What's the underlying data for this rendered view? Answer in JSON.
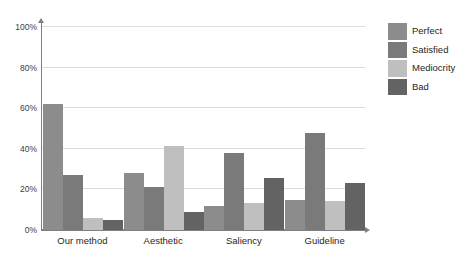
{
  "chart_data": {
    "type": "bar",
    "title": "",
    "subtitle": "",
    "xlabel": "",
    "ylabel": "",
    "categories": [
      "Our method",
      "Aesthetic",
      "Saliency",
      "Guideline"
    ],
    "series": [
      {
        "name": "Perfect",
        "color": "#8c8c8c",
        "values": [
          62,
          28,
          12,
          15
        ]
      },
      {
        "name": "Satisfied",
        "color": "#7a7a7a",
        "values": [
          27,
          21,
          38,
          48
        ]
      },
      {
        "name": "Mediocrity",
        "color": "#bfbfbf",
        "values": [
          6,
          41.5,
          13.5,
          14.5
        ]
      },
      {
        "name": "Bad",
        "color": "#636363",
        "values": [
          5,
          9,
          25.5,
          23
        ]
      }
    ],
    "ylim": [
      0,
      100
    ],
    "yticks": [
      0,
      20,
      40,
      60,
      80,
      100
    ],
    "ytick_labels": [
      "0%",
      "20%",
      "40%",
      "60%",
      "80%",
      "100%"
    ],
    "grid": true,
    "grid_axis": "y",
    "legend_position": "right",
    "axis_color": "#808080",
    "grid_color": "#d9dde2",
    "background": "#ffffff"
  },
  "legend": {
    "items": [
      {
        "label": "Perfect"
      },
      {
        "label": "Satisfied"
      },
      {
        "label": "Mediocrity"
      },
      {
        "label": "Bad"
      }
    ]
  }
}
